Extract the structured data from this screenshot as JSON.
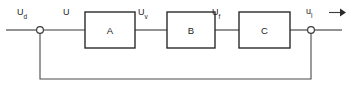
{
  "diagram": {
    "type": "control-loop-block-diagram",
    "background_color": "#ffffff",
    "line_color": "#3a3a3a",
    "block_border_color": "#2b2b2b",
    "blocks": [
      {
        "label": "A",
        "x": 85,
        "y": 12,
        "width": 50,
        "height": 36
      },
      {
        "label": "B",
        "x": 167,
        "y": 12,
        "width": 48,
        "height": 36
      },
      {
        "label": "C",
        "x": 239,
        "y": 12,
        "width": 51,
        "height": 36
      }
    ],
    "signals": [
      {
        "name": "input-reference",
        "base": "U",
        "sub": "d"
      },
      {
        "name": "error-signal",
        "base": "U",
        "sub": ""
      },
      {
        "name": "block-a-output",
        "base": "U",
        "sub": "v"
      },
      {
        "name": "block-b-output",
        "base": "U",
        "sub": "f"
      },
      {
        "name": "output-signal",
        "base": "u",
        "sub": "l"
      }
    ],
    "nodes": [
      {
        "name": "summing-node",
        "cx": 40,
        "cy": 30,
        "r": 3.4
      },
      {
        "name": "output-node",
        "cx": 311,
        "cy": 30,
        "r": 3.4
      }
    ],
    "feedback": {
      "from_x": 311,
      "to_x": 40,
      "y": 79
    },
    "output_arrow": {
      "x": 329,
      "y": 12,
      "length": 14
    },
    "main_line_y": 30
  }
}
